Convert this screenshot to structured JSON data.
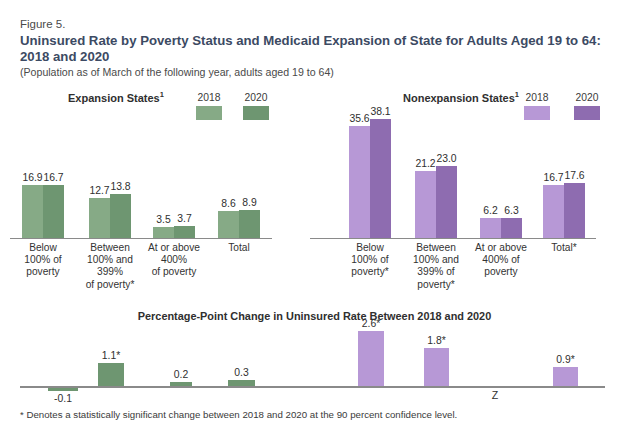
{
  "figure": {
    "label": "Figure 5.",
    "title": "Uninsured Rate by Poverty Status and Medicaid Expansion of State for Adults Aged 19 to 64: 2018 and 2020",
    "subtitle": "(Population as of March of the following year, adults aged 19 to 64)",
    "footnote": "* Denotes a statistically significant change between 2018 and 2020 at the 90 percent confidence level."
  },
  "colors": {
    "green_2018": "#86aa86",
    "green_2020": "#6e9671",
    "purple_2018": "#b798d6",
    "purple_2020": "#8e6cb0",
    "title_blue": "#3c4a63",
    "axis": "#8a8a8a"
  },
  "panels": {
    "expansion": {
      "title": "Expansion States",
      "title_superscript": "1",
      "legend": [
        "2018",
        "2020"
      ]
    },
    "nonexpansion": {
      "title": "Nonexpansion States",
      "title_superscript": "1",
      "legend": [
        "2018",
        "2020"
      ]
    },
    "change": {
      "title": "Percentage-Point Change in Uninsured Rate Between 2018 and 2020"
    }
  },
  "chart_data": [
    {
      "type": "bar",
      "title": "Expansion States",
      "ylabel": "Uninsured rate (percent)",
      "xlabel": "",
      "ylim": [
        0,
        40
      ],
      "grid": false,
      "legend_position": "top-right",
      "categories": [
        "Below 100% of poverty",
        "Between 100% and 399% of poverty*",
        "At or above 400% of poverty",
        "Total"
      ],
      "category_lines": [
        [
          "Below",
          "100% of",
          "poverty"
        ],
        [
          "Between",
          "100% and",
          "399%",
          "of poverty*"
        ],
        [
          "At or above",
          "400%",
          "of poverty"
        ],
        [
          "Total"
        ]
      ],
      "series": [
        {
          "name": "2018",
          "values": [
            16.9,
            12.7,
            3.5,
            8.6
          ],
          "labels": [
            "16.9",
            "12.7",
            "3.5",
            "8.6"
          ]
        },
        {
          "name": "2020",
          "values": [
            16.7,
            13.8,
            3.7,
            8.9
          ],
          "labels": [
            "16.7",
            "13.8",
            "3.7",
            "8.9"
          ]
        }
      ]
    },
    {
      "type": "bar",
      "title": "Nonexpansion States",
      "ylabel": "Uninsured rate (percent)",
      "xlabel": "",
      "ylim": [
        0,
        40
      ],
      "grid": false,
      "legend_position": "top-right",
      "categories": [
        "Below 100% of poverty*",
        "Between 100% and 399% of poverty*",
        "At or above 400% of poverty",
        "Total*"
      ],
      "category_lines": [
        [
          "Below",
          "100% of",
          "poverty*"
        ],
        [
          "Between",
          "100% and",
          "399% of",
          "poverty*"
        ],
        [
          "At or above",
          "400% of",
          "poverty"
        ],
        [
          "Total*"
        ]
      ],
      "series": [
        {
          "name": "2018",
          "values": [
            35.6,
            21.2,
            6.2,
            16.7
          ],
          "labels": [
            "35.6",
            "21.2",
            "6.2",
            "16.7"
          ]
        },
        {
          "name": "2020",
          "values": [
            38.1,
            23.0,
            6.3,
            17.6
          ],
          "labels": [
            "38.1",
            "23.0",
            "6.3",
            "17.6"
          ]
        }
      ]
    },
    {
      "type": "bar",
      "title": "Percentage-Point Change in Uninsured Rate Between 2018 and 2020",
      "ylabel": "Percentage-point change",
      "xlabel": "",
      "ylim": [
        -0.5,
        3.0
      ],
      "grid": false,
      "categories": [
        "Expansion: Below 100% of poverty",
        "Expansion: Between 100% and 399% of poverty",
        "Expansion: At or above 400% of poverty",
        "Expansion: Total",
        "Nonexpansion: Below 100% of poverty",
        "Nonexpansion: Between 100% and 399% of poverty",
        "Nonexpansion: At or above 400% of poverty",
        "Nonexpansion: Total"
      ],
      "values": [
        -0.1,
        1.1,
        0.2,
        0.3,
        2.6,
        1.8,
        0.0,
        0.9
      ],
      "labels": [
        "-0.1",
        "1.1*",
        "0.2",
        "0.3",
        "2.6*",
        "1.8*",
        "Z",
        "0.9*"
      ],
      "significant": [
        false,
        true,
        false,
        false,
        true,
        true,
        false,
        true
      ],
      "group_colors": [
        "green",
        "green",
        "green",
        "green",
        "purple",
        "purple",
        "purple",
        "purple"
      ]
    }
  ]
}
